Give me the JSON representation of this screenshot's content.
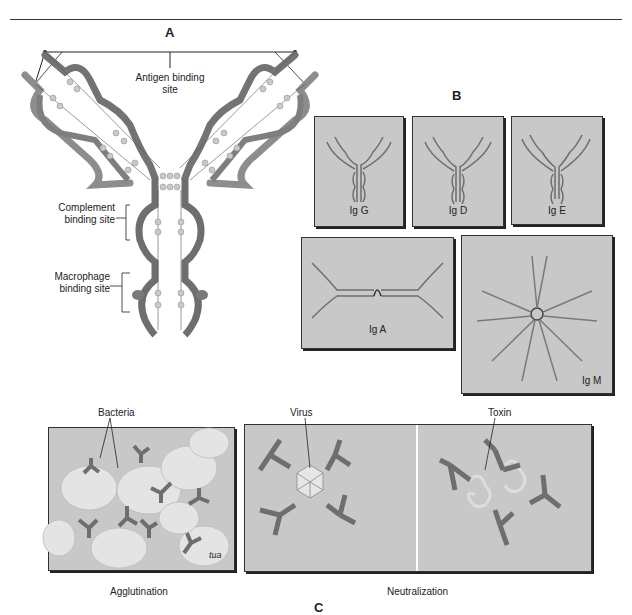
{
  "panels": {
    "a": {
      "letter": "A",
      "labels": {
        "antigen_binding_site": "Antigen binding\nsite",
        "complement_binding_site": "Complement\nbinding site",
        "macrophage_binding_site": "Macrophage\nbinding site"
      }
    },
    "b": {
      "letter": "B",
      "boxes": [
        {
          "label": "Ig G"
        },
        {
          "label": "Ig D"
        },
        {
          "label": "Ig E"
        },
        {
          "label": "Ig A"
        },
        {
          "label": "Ig M"
        }
      ]
    },
    "c": {
      "letter": "C",
      "labels": {
        "bacteria": "Bacteria",
        "virus": "Virus",
        "toxin": "Toxin",
        "agglutination": "Agglutination",
        "neutralization": "Neutralization",
        "signature": "tua"
      }
    }
  },
  "colors": {
    "antibody_dark": "#6e6e6e",
    "antibody_light": "#9a9a9a",
    "box_fill": "#c8c8c8",
    "bead": "#c9c9c9"
  }
}
